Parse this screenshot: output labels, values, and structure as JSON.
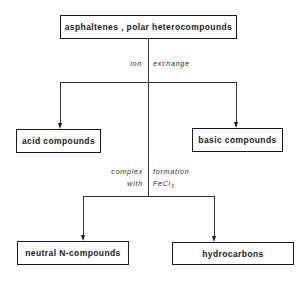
{
  "diagram": {
    "type": "flowchart",
    "root": {
      "label": "asphaltenes , polar heterocompounds"
    },
    "step1": {
      "method_left": "ion",
      "method_right": "exchange",
      "outputs": [
        {
          "label": "acid compounds"
        },
        {
          "label": "basic compounds"
        }
      ]
    },
    "step2": {
      "method_left_line1": "complex",
      "method_right_line1": "formation",
      "method_left_line2": "with",
      "method_right_line2": "FeCl",
      "method_right_line2_sub": "3",
      "outputs": [
        {
          "label": "neutral N-compounds"
        },
        {
          "label": "hydrocarbons"
        }
      ]
    },
    "colors": {
      "line": "#1a1a1a",
      "background": "#ffffff"
    }
  }
}
